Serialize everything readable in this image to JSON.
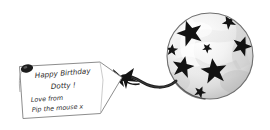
{
  "scene": {
    "title": "Birthday gift tag attached to a star-patterned balloon",
    "background_color": "#ffffff",
    "width": 270,
    "height": 130
  },
  "gift_tag": {
    "name": "gift-tag",
    "shape": "pentagon-pointed-right",
    "fill_color": "#ffffff",
    "outline_color": "#8d8d8d",
    "eyelet": {
      "name": "tag-eyelet-hole",
      "color": "#1c1c1c",
      "description": "dark oval punched hole at top-left of tag"
    },
    "message_lines": [
      "Happy Birthday",
      "Dotty !",
      "Love from",
      "Pip the mouse x"
    ],
    "ink_color": "#2b2b2b"
  },
  "string": {
    "name": "balloon-string",
    "color": "#1f1f1f",
    "description": "curved dark ribbon from balloon to tag point"
  },
  "bow": {
    "name": "ribbon-bow-knot",
    "color": "#141414",
    "description": "dark bow tie knot where string meets the tag point"
  },
  "balloon": {
    "name": "star-balloon",
    "shape": "circle",
    "center_x": 210,
    "center_y": 56,
    "radius": 43,
    "body_color": "#e9e9e9",
    "highlight_color": "#ffffff",
    "shade_color": "#c2c2c2",
    "outline_color": "#6f6f6f",
    "star_color": "#131313",
    "star_count": 8,
    "pattern": "black five-pointed stars on mottled white and grey latex",
    "stars": [
      {
        "name": "star-upper-left",
        "cx": 190,
        "cy": 33,
        "r": 13,
        "rot": -18
      },
      {
        "name": "star-lower-left",
        "cx": 183,
        "cy": 67,
        "r": 11,
        "rot": 12
      },
      {
        "name": "star-center",
        "cx": 214,
        "cy": 71,
        "r": 13,
        "rot": -8
      },
      {
        "name": "star-right-upper",
        "cx": 242,
        "cy": 46,
        "r": 10,
        "rot": 20
      },
      {
        "name": "star-top-right",
        "cx": 229,
        "cy": 22,
        "r": 7,
        "rot": -30
      },
      {
        "name": "star-left-edge",
        "cx": 172,
        "cy": 50,
        "r": 6,
        "rot": 5
      },
      {
        "name": "star-bottom",
        "cx": 200,
        "cy": 92,
        "r": 6,
        "rot": 25
      },
      {
        "name": "star-small-mid",
        "cx": 207,
        "cy": 48,
        "r": 5,
        "rot": -40
      }
    ]
  }
}
